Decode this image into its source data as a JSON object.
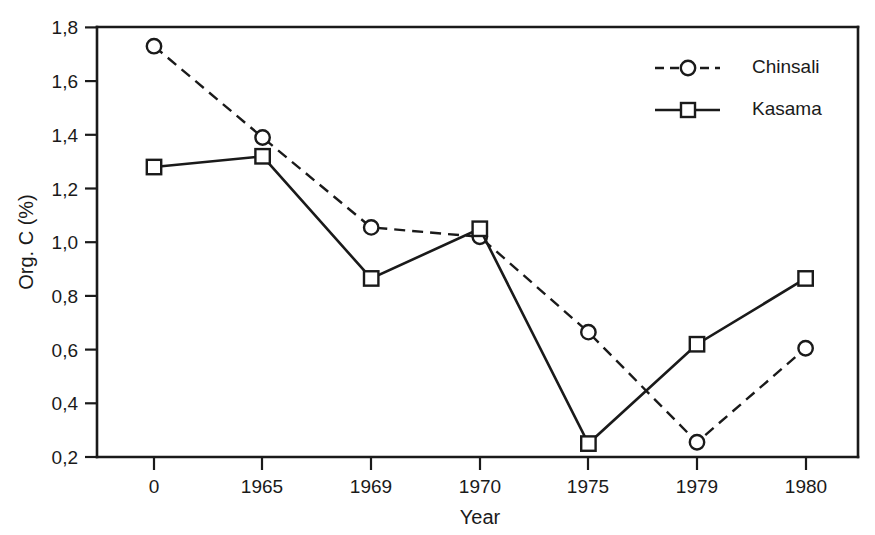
{
  "chart_data": {
    "type": "line",
    "title": "",
    "xlabel": "Year",
    "ylabel": "Org. C (%)",
    "categories": [
      "0",
      "1965",
      "1969",
      "1970",
      "1975",
      "1979",
      "1980"
    ],
    "ylim": [
      0.2,
      1.8
    ],
    "yticks": [
      "0,2",
      "0,4",
      "0,6",
      "0,8",
      "1,0",
      "1,2",
      "1,4",
      "1,6",
      "1,8"
    ],
    "ytick_values": [
      0.2,
      0.4,
      0.6,
      0.8,
      1.0,
      1.2,
      1.4,
      1.6,
      1.8
    ],
    "grid": false,
    "legend_position": "top-right",
    "decimal_separator": ",",
    "series": [
      {
        "name": "Chinsali",
        "marker": "circle",
        "linestyle": "dashed",
        "color": "#1a1a1a",
        "values": [
          1.73,
          1.39,
          1.055,
          1.02,
          0.665,
          0.255,
          0.605
        ]
      },
      {
        "name": "Kasama",
        "marker": "square",
        "linestyle": "solid",
        "color": "#1a1a1a",
        "values": [
          1.28,
          1.32,
          0.865,
          1.05,
          0.25,
          0.62,
          0.865
        ]
      }
    ]
  },
  "axes": {
    "y_title": "Org. C (%)",
    "x_title": "Year"
  },
  "legend": {
    "entries": [
      {
        "label": "Chinsali",
        "marker": "circle",
        "linestyle": "dashed"
      },
      {
        "label": "Kasama",
        "marker": "square",
        "linestyle": "solid"
      }
    ]
  },
  "colors": {
    "ink": "#1a1a1a",
    "background": "#ffffff"
  }
}
